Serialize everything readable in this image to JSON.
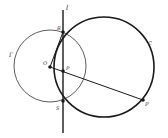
{
  "diagram": {
    "labels": {
      "line": "l",
      "circle_gamma": "Γ",
      "circle_c": "C",
      "point_o": "O",
      "point_p": "P",
      "point_r": "R",
      "point_s": "S",
      "point_p_prime": "P′"
    },
    "colors": {
      "stroke": "#1a1a1a",
      "background": "#ffffff"
    }
  }
}
